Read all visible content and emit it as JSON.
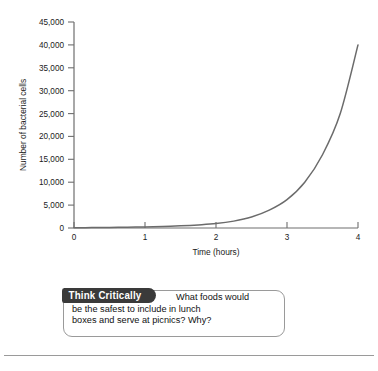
{
  "chart_data": {
    "type": "line",
    "title": "",
    "xlabel": "Time (hours)",
    "ylabel": "Number of bacterial cells",
    "xlim": [
      0,
      4
    ],
    "ylim": [
      0,
      45000
    ],
    "grid": false,
    "legend": "none",
    "line_color": "#6b6b6b",
    "x_ticks": [
      "0",
      "1",
      "2",
      "3",
      "4"
    ],
    "y_ticks": [
      "0",
      "5,000",
      "10,000",
      "15,000",
      "20,000",
      "25,000",
      "30,000",
      "35,000",
      "40,000",
      "45,000"
    ],
    "series": [
      {
        "name": "Bacterial growth",
        "x": [
          0,
          0.25,
          0.5,
          0.75,
          1,
          1.25,
          1.5,
          1.75,
          2,
          2.25,
          2.5,
          2.75,
          3,
          3.25,
          3.5,
          3.75,
          4
        ],
        "values": [
          60,
          85,
          120,
          170,
          240,
          340,
          480,
          680,
          960,
          1500,
          2400,
          3900,
          6200,
          10000,
          16000,
          25000,
          40000
        ]
      }
    ]
  },
  "figure": {
    "y_axis_title": "Number of bacterial cells",
    "x_axis_title": "Time (hours)"
  },
  "callout": {
    "badge_label": "Think Critically",
    "line1": "What foods would",
    "line2": "be the safest to include in lunch",
    "line3": "boxes and serve at picnics? Why?"
  }
}
